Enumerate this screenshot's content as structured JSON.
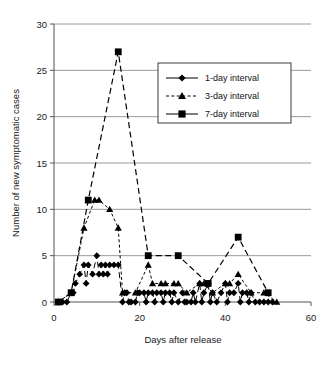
{
  "chart_data": {
    "type": "line",
    "title": "",
    "xlabel": "Days after release",
    "ylabel": "Number of new symptomatic cases",
    "xlim": [
      0,
      60
    ],
    "ylim": [
      0,
      30
    ],
    "xticks": [
      0,
      20,
      40,
      60
    ],
    "yticks": [
      0,
      5,
      10,
      15,
      20,
      25,
      30
    ],
    "xtick_labels": [
      "0",
      "20",
      "40",
      "60"
    ],
    "ytick_labels": [
      "0",
      "5",
      "10",
      "15",
      "20",
      "25",
      "30"
    ],
    "grid": "horizontal",
    "legend_position": "upper-right-inside",
    "series": [
      {
        "name": "1-day interval",
        "marker": "diamond",
        "linestyle": "solid",
        "color": "#000000",
        "points": [
          [
            1,
            0
          ],
          [
            2,
            0
          ],
          [
            3,
            0
          ],
          [
            4,
            1
          ],
          [
            4.5,
            1
          ],
          [
            5,
            2
          ],
          [
            6,
            3
          ],
          [
            7,
            4
          ],
          [
            7.5,
            2
          ],
          [
            8,
            4
          ],
          [
            9,
            3
          ],
          [
            10,
            5
          ],
          [
            10.5,
            3
          ],
          [
            11,
            4
          ],
          [
            11.5,
            3
          ],
          [
            12,
            4
          ],
          [
            12.5,
            3
          ],
          [
            13,
            4
          ],
          [
            14,
            4
          ],
          [
            15,
            4
          ],
          [
            16,
            0
          ],
          [
            16.5,
            1
          ],
          [
            17,
            1
          ],
          [
            17.5,
            0
          ],
          [
            18,
            0
          ],
          [
            19,
            0
          ],
          [
            19.5,
            1
          ],
          [
            20,
            1
          ],
          [
            21,
            1
          ],
          [
            21.5,
            0
          ],
          [
            22,
            1
          ],
          [
            23,
            1
          ],
          [
            23.5,
            0
          ],
          [
            24,
            1
          ],
          [
            25,
            1
          ],
          [
            25.5,
            0
          ],
          [
            26,
            1
          ],
          [
            27,
            1
          ],
          [
            27.5,
            0
          ],
          [
            28,
            1
          ],
          [
            29,
            0
          ],
          [
            30,
            1
          ],
          [
            30.5,
            0
          ],
          [
            31,
            0
          ],
          [
            32,
            0
          ],
          [
            32.5,
            1
          ],
          [
            33,
            0
          ],
          [
            34,
            2
          ],
          [
            34.5,
            0
          ],
          [
            35,
            1
          ],
          [
            36,
            2
          ],
          [
            36.5,
            0
          ],
          [
            37,
            1
          ],
          [
            38,
            0
          ],
          [
            39,
            1
          ],
          [
            40,
            2
          ],
          [
            40.5,
            0
          ],
          [
            41,
            1
          ],
          [
            42,
            1
          ],
          [
            43,
            2
          ],
          [
            43.5,
            0
          ],
          [
            44,
            1
          ],
          [
            45,
            1
          ],
          [
            45.5,
            0
          ],
          [
            46,
            1
          ],
          [
            47,
            0
          ],
          [
            48,
            0
          ],
          [
            49,
            0
          ],
          [
            50,
            0
          ],
          [
            51,
            0
          ]
        ]
      },
      {
        "name": "3-day interval",
        "marker": "triangle",
        "linestyle": "dashed",
        "color": "#000000",
        "points": [
          [
            1,
            0
          ],
          [
            4,
            1
          ],
          [
            7,
            8
          ],
          [
            9.5,
            11
          ],
          [
            10.5,
            11
          ],
          [
            13,
            10
          ],
          [
            15,
            8
          ],
          [
            16,
            1
          ],
          [
            19,
            1
          ],
          [
            22,
            4
          ],
          [
            23,
            2
          ],
          [
            25,
            2
          ],
          [
            26,
            2
          ],
          [
            28,
            2
          ],
          [
            29,
            2
          ],
          [
            31,
            1
          ],
          [
            34,
            2
          ],
          [
            35,
            2
          ],
          [
            37,
            1
          ],
          [
            40,
            2
          ],
          [
            41,
            2
          ],
          [
            43,
            3
          ],
          [
            46,
            1
          ],
          [
            49,
            1
          ],
          [
            52,
            0
          ]
        ]
      },
      {
        "name": "7-day interval",
        "marker": "square",
        "linestyle": "solid",
        "color": "#000000",
        "points": [
          [
            1,
            0
          ],
          [
            4,
            1
          ],
          [
            8,
            11
          ],
          [
            15,
            27
          ],
          [
            22,
            5
          ],
          [
            29,
            5
          ],
          [
            36,
            2
          ],
          [
            43,
            7
          ],
          [
            50,
            1
          ]
        ]
      }
    ]
  },
  "legend": {
    "entries": [
      {
        "label": "1-day interval",
        "marker": "diamond",
        "linestyle": "solid"
      },
      {
        "label": "3-day interval",
        "marker": "triangle",
        "linestyle": "dashed"
      },
      {
        "label": "7-day interval",
        "marker": "square",
        "linestyle": "solid"
      }
    ]
  },
  "axes": {
    "y_title": "Number of new symptomatic cases",
    "x_title": "Days after release"
  }
}
